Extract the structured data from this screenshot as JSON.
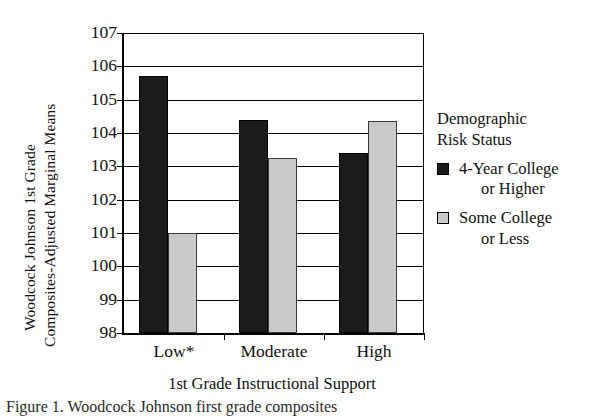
{
  "chart_data": {
    "type": "bar",
    "title": "",
    "xlabel": "1st Grade Instructional Support",
    "ylabel": "Woodcock Johnson 1st Grade Composites-Adjusted Marginal Means",
    "ylabel_line1": "Woodcock Johnson 1st Grade",
    "ylabel_line2": "Composites-Adjusted Marginal Means",
    "categories": [
      "Low*",
      "Moderate",
      "High"
    ],
    "ylim": [
      98,
      107
    ],
    "ytick_labels": [
      "107",
      "106",
      "105",
      "104",
      "103",
      "102",
      "101",
      "100",
      "99",
      "98"
    ],
    "ytick_values": [
      107,
      106,
      105,
      104,
      103,
      102,
      101,
      100,
      99,
      98
    ],
    "grid": true,
    "legend_position": "right",
    "legend_title_line1": "Demographic",
    "legend_title_line2": "Risk Status",
    "series": [
      {
        "name": "4-Year College or Higher",
        "name_line1": "4-Year College",
        "name_line2": "or Higher",
        "color": "#1c1c1c",
        "values": [
          105.7,
          104.4,
          103.4
        ]
      },
      {
        "name": "Some College or Less",
        "name_line1": "Some College",
        "name_line2": "or Less",
        "color": "#c9c9c9",
        "values": [
          101.0,
          103.25,
          104.35
        ]
      }
    ]
  },
  "caption": "Figure 1. Woodcock Johnson first grade composites"
}
